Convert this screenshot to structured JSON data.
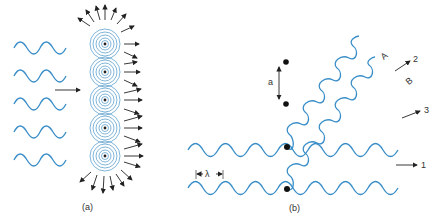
{
  "figure": {
    "panel_a": {
      "label": "(a)",
      "incident_waves": 5,
      "scatterers": 5,
      "description": "Plane waves incident from left on a vertical row of scatterers; each emits concentric spherical wavelets radiating outward (arrows)."
    },
    "panel_b": {
      "label": "(b)",
      "spacing_label": "a",
      "wavelength_label": "λ",
      "ray_labels": [
        "A",
        "B"
      ],
      "direction_labels": [
        "1",
        "2",
        "3"
      ],
      "description": "Two incident waves scattered by two atoms separated by a; scattered rays A and B travel at an angle."
    },
    "colors": {
      "wave": "#3a8ec8",
      "ink": "#222222"
    },
    "caption": ""
  }
}
